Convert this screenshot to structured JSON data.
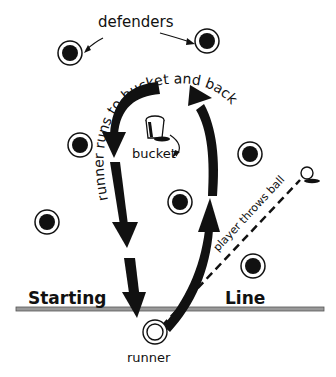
{
  "labels": {
    "defenders": "defenders",
    "runner_path": "runner runs to bucket and back",
    "bucket": "bucket",
    "thrower": "player throws ball",
    "starting": "Starting",
    "line": "Line",
    "runner": "runner"
  },
  "defenders": [
    {
      "x": 70,
      "y": 53
    },
    {
      "x": 207,
      "y": 41
    },
    {
      "x": 80,
      "y": 145
    },
    {
      "x": 250,
      "y": 154
    },
    {
      "x": 47,
      "y": 222
    },
    {
      "x": 180,
      "y": 202
    },
    {
      "x": 253,
      "y": 266
    }
  ],
  "colors": {
    "ink": "#111111",
    "line": "#888888"
  }
}
